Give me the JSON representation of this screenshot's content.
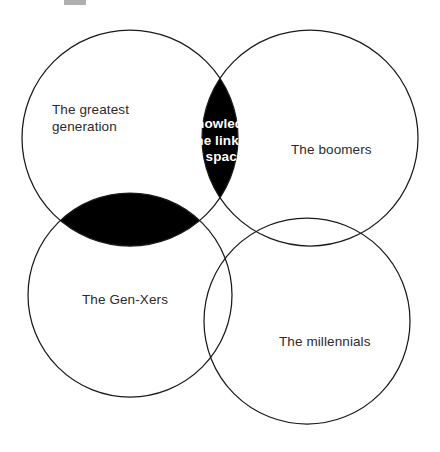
{
  "diagram": {
    "type": "venn",
    "background_color": "#ffffff",
    "outline_color": "#1a1a1a",
    "fill_color": "#000000",
    "label_color": "#2b2b2b",
    "center_label_color": "#ffffff",
    "sets": [
      {
        "id": "greatest-generation",
        "label": "The greatest\ngeneration",
        "cx": 130,
        "cy": 138,
        "r": 108
      },
      {
        "id": "boomers",
        "label": "The boomers",
        "cx": 310,
        "cy": 138,
        "r": 108
      },
      {
        "id": "gen-xers",
        "label": "The Gen-Xers",
        "cx": 130,
        "cy": 295,
        "r": 102
      },
      {
        "id": "millennials",
        "label": "The millennials",
        "cx": 307,
        "cy": 321,
        "r": 103
      }
    ],
    "intersection": {
      "id": "knowledge-linking-space",
      "label": "Knowledge:\nthe linking\nspace",
      "shaded": true,
      "shaded_pairs": [
        "greatest-generation ∩ boomers",
        "greatest-generation ∩ gen-xers",
        "boomers ∩ gen-xers"
      ]
    }
  }
}
